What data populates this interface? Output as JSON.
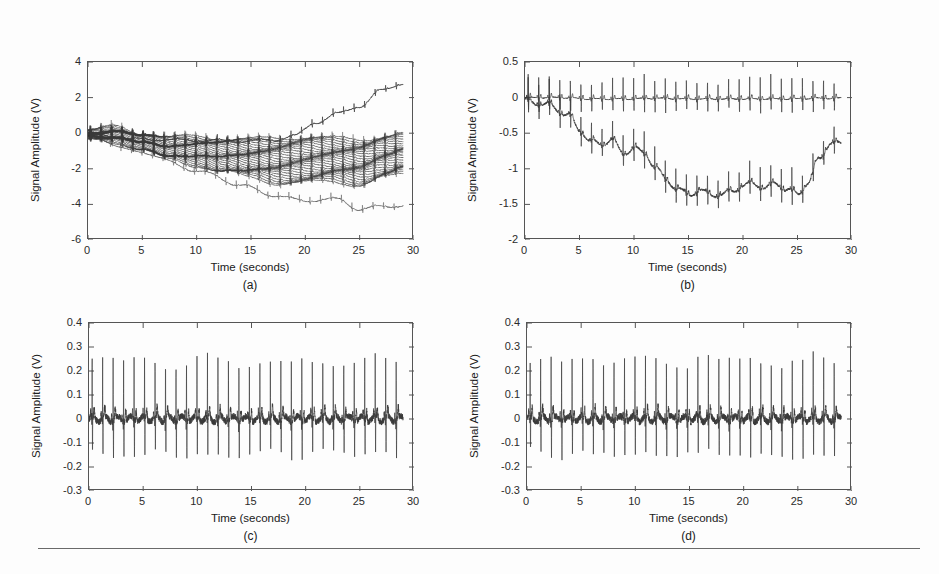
{
  "figure": {
    "background_color": "#fdfdfd",
    "axis_color": "#555555",
    "trace_color": "#3a3a3a",
    "rule": {
      "x": 38,
      "y": 548,
      "width": 882
    }
  },
  "common": {
    "xlabel": "Time (seconds)",
    "ylabel": "Signal Amplitude (V)",
    "xticks": [
      "0",
      "5",
      "10",
      "15",
      "20",
      "25",
      "30"
    ],
    "xtick_values": [
      0,
      5,
      10,
      15,
      20,
      25,
      30
    ]
  },
  "panels": [
    {
      "id": "a",
      "caption": "(a)",
      "box": {
        "left": 87,
        "top": 61,
        "width": 326,
        "height": 178
      },
      "yticks": [
        "4",
        "2",
        "0",
        "-2",
        "-4",
        "-6"
      ],
      "ytick_values": [
        4,
        2,
        0,
        -2,
        -4,
        -6
      ]
    },
    {
      "id": "b",
      "caption": "(b)",
      "box": {
        "left": 524,
        "top": 61,
        "width": 327,
        "height": 178
      },
      "yticks": [
        "0.5",
        "0",
        "-0.5",
        "-1",
        "-1.5",
        "-2"
      ],
      "ytick_values": [
        0.5,
        0,
        -0.5,
        -1,
        -1.5,
        -2
      ]
    },
    {
      "id": "c",
      "caption": "(c)",
      "box": {
        "left": 88,
        "top": 322,
        "width": 325,
        "height": 168
      },
      "yticks": [
        "0.4",
        "0.3",
        "0.2",
        "0.1",
        "0",
        "-0.1",
        "-0.2",
        "-0.3"
      ],
      "ytick_values": [
        0.4,
        0.3,
        0.2,
        0.1,
        0,
        -0.1,
        -0.2,
        -0.3
      ]
    },
    {
      "id": "d",
      "caption": "(d)",
      "box": {
        "left": 526,
        "top": 322,
        "width": 325,
        "height": 168
      },
      "yticks": [
        "0.4",
        "0.3",
        "0.2",
        "0.1",
        "0",
        "-0.1",
        "-0.2",
        "-0.3"
      ],
      "ytick_values": [
        0.4,
        0.3,
        0.2,
        0.1,
        0,
        -0.1,
        -0.2,
        -0.3
      ]
    }
  ],
  "chart_data": [
    {
      "panel": "a",
      "type": "line",
      "title": "(a)",
      "xlabel": "Time (seconds)",
      "ylabel": "Signal Amplitude (V)",
      "xlim": [
        0,
        30
      ],
      "ylim": [
        -6,
        4
      ],
      "xticks": [
        0,
        5,
        10,
        15,
        20,
        25,
        30
      ],
      "yticks": [
        -6,
        -4,
        -2,
        0,
        2,
        4
      ],
      "grid": false,
      "legend": "none",
      "description": "Raw multi-channel ECG bundle with baseline wander; ~30 overlapping traces",
      "n_traces": 30,
      "signal_duration_s": 29,
      "heart_rate_bpm": 62,
      "qrs_amplitude": 0.35,
      "series": [
        {
          "name": "bundle-envelope-top",
          "x": [
            0,
            2.5,
            5,
            7.5,
            10,
            12.5,
            15,
            17.5,
            20,
            22.5,
            25,
            27.5,
            29
          ],
          "values": [
            0.1,
            0.35,
            0.0,
            -0.25,
            -0.2,
            -0.3,
            -0.35,
            -0.3,
            -0.2,
            -0.3,
            -0.35,
            -0.15,
            -0.05
          ]
        },
        {
          "name": "bundle-envelope-bottom",
          "x": [
            0,
            2.5,
            5,
            7.5,
            10,
            12.5,
            15,
            17.5,
            20,
            22.5,
            25,
            27.5,
            29
          ],
          "values": [
            -0.3,
            -0.5,
            -0.9,
            -1.5,
            -1.8,
            -2.2,
            -2.5,
            -2.8,
            -2.8,
            -2.7,
            -2.9,
            -2.5,
            -2.3
          ]
        },
        {
          "name": "outlier-rising",
          "x": [
            0,
            5,
            10,
            14,
            17,
            19,
            21,
            23,
            25,
            27,
            29
          ],
          "values": [
            -0.1,
            -0.35,
            -0.4,
            -0.45,
            -0.4,
            -0.15,
            0.6,
            1.1,
            1.5,
            2.4,
            2.8
          ]
        },
        {
          "name": "outlier-falling",
          "x": [
            0,
            5,
            10,
            14,
            17,
            20,
            23,
            25,
            27,
            29
          ],
          "values": [
            -0.2,
            -1.1,
            -2.1,
            -2.9,
            -3.5,
            -3.8,
            -3.7,
            -4.3,
            -4.1,
            -4.1
          ]
        }
      ]
    },
    {
      "panel": "b",
      "type": "line",
      "title": "(b)",
      "xlabel": "Time (seconds)",
      "ylabel": "Signal Amplitude (V)",
      "xlim": [
        0,
        30
      ],
      "ylim": [
        -2,
        0.5
      ],
      "xticks": [
        0,
        5,
        10,
        15,
        20,
        25,
        30
      ],
      "yticks": [
        -2,
        -1.5,
        -1,
        -0.5,
        0,
        0.5
      ],
      "grid": false,
      "legend": "none",
      "description": "Two ECG channels: stable baseline trace near 0 V and a wandering trace dipping to about -1.4 V",
      "n_traces": 2,
      "signal_duration_s": 29,
      "heart_rate_bpm": 62,
      "qrs_amplitude": 0.3,
      "series": [
        {
          "name": "stable-baseline-trace",
          "x": [
            0,
            3,
            6,
            9,
            12,
            15,
            18,
            21,
            24,
            27,
            29
          ],
          "values": [
            0.0,
            0.0,
            -0.02,
            -0.02,
            -0.01,
            -0.02,
            -0.02,
            -0.02,
            -0.02,
            -0.01,
            -0.01
          ]
        },
        {
          "name": "wandering-trace",
          "x": [
            0,
            2,
            4,
            5,
            6,
            7,
            8,
            9,
            10,
            11,
            12,
            13,
            14,
            15,
            16,
            17,
            18,
            19,
            20,
            21,
            22,
            23,
            24,
            25,
            26,
            27,
            28,
            29
          ],
          "values": [
            -0.05,
            -0.1,
            -0.25,
            -0.45,
            -0.62,
            -0.65,
            -0.6,
            -0.78,
            -0.72,
            -0.78,
            -1.0,
            -1.15,
            -1.3,
            -1.35,
            -1.32,
            -1.35,
            -1.38,
            -1.3,
            -1.25,
            -1.2,
            -1.28,
            -1.2,
            -1.3,
            -1.35,
            -1.2,
            -0.85,
            -0.65,
            -0.65
          ]
        }
      ]
    },
    {
      "panel": "c",
      "type": "line",
      "title": "(c)",
      "xlabel": "Time (seconds)",
      "ylabel": "Signal Amplitude (V)",
      "xlim": [
        0,
        30
      ],
      "ylim": [
        -0.3,
        0.4
      ],
      "xticks": [
        0,
        5,
        10,
        15,
        20,
        25,
        30
      ],
      "yticks": [
        -0.3,
        -0.2,
        -0.1,
        0,
        0.1,
        0.2,
        0.3,
        0.4
      ],
      "grid": false,
      "legend": "none",
      "description": "Baseline-corrected ECG centred on 0 V with sharp R peaks near 0.3 V and S troughs near -0.2 V",
      "n_traces": 1,
      "signal_duration_s": 29,
      "heart_rate_bpm": 62,
      "r_peak_amplitude": 0.3,
      "s_trough_amplitude": -0.18,
      "baseline": 0.0
    },
    {
      "panel": "d",
      "type": "line",
      "title": "(d)",
      "xlabel": "Time (seconds)",
      "ylabel": "Signal Amplitude (V)",
      "xlim": [
        0,
        30
      ],
      "ylim": [
        -0.3,
        0.4
      ],
      "xticks": [
        0,
        5,
        10,
        15,
        20,
        25,
        30
      ],
      "yticks": [
        -0.3,
        -0.2,
        -0.1,
        0,
        0.1,
        0.2,
        0.3,
        0.4
      ],
      "grid": false,
      "legend": "none",
      "description": "Reconstructed ECG after processing, visually near-identical to panel (c)",
      "n_traces": 1,
      "signal_duration_s": 29,
      "heart_rate_bpm": 62,
      "r_peak_amplitude": 0.3,
      "s_trough_amplitude": -0.18,
      "baseline": 0.0
    }
  ]
}
